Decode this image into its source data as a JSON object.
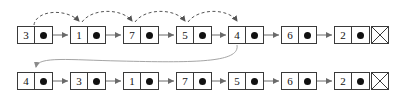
{
  "figure": {
    "background_color": "#ffffff",
    "node_border_color": "#3a3a3a",
    "text_color": "#111111",
    "arrow_color": "#6a6a6a",
    "dashed_arc_color": "#555555",
    "curve_color": "#9a9a9a",
    "pointer_symbol": "•",
    "null_symbol": "X"
  },
  "rows": [
    {
      "id": "top-row",
      "name": "before",
      "y": 26,
      "nodes": [
        {
          "key": "3",
          "ptr": "•",
          "x": 17
        },
        {
          "key": "1",
          "ptr": "•",
          "x": 70
        },
        {
          "key": "7",
          "ptr": "•",
          "x": 123
        },
        {
          "key": "5",
          "ptr": "•",
          "x": 176
        },
        {
          "key": "4",
          "ptr": "•",
          "x": 228
        },
        {
          "key": "6",
          "ptr": "•",
          "x": 281
        },
        {
          "key": "2",
          "ptr": "•",
          "x": 334
        }
      ],
      "terminator": {
        "x": 371,
        "y": 26,
        "label": "null"
      }
    },
    {
      "id": "bottom-row",
      "name": "after",
      "y": 72,
      "nodes": [
        {
          "key": "4",
          "ptr": "•",
          "x": 17
        },
        {
          "key": "3",
          "ptr": "•",
          "x": 70
        },
        {
          "key": "1",
          "ptr": "•",
          "x": 123
        },
        {
          "key": "7",
          "ptr": "•",
          "x": 176
        },
        {
          "key": "5",
          "ptr": "•",
          "x": 228
        },
        {
          "key": "6",
          "ptr": "•",
          "x": 281
        },
        {
          "key": "2",
          "ptr": "•",
          "x": 334
        }
      ],
      "terminator": {
        "x": 371,
        "y": 72,
        "label": "null"
      }
    }
  ],
  "next_arrows": {
    "style": "solid",
    "top": [
      {
        "x1": 53,
        "x2": 69,
        "y": 35
      },
      {
        "x1": 106,
        "x2": 122,
        "y": 35
      },
      {
        "x1": 159,
        "x2": 175,
        "y": 35
      },
      {
        "x1": 212,
        "x2": 227,
        "y": 35
      },
      {
        "x1": 264,
        "x2": 280,
        "y": 35
      },
      {
        "x1": 317,
        "x2": 333,
        "y": 35
      },
      {
        "x1": 370,
        "x2": 370,
        "y": 35
      }
    ],
    "bottom": [
      {
        "x1": 53,
        "x2": 69,
        "y": 81
      },
      {
        "x1": 106,
        "x2": 122,
        "y": 81
      },
      {
        "x1": 159,
        "x2": 175,
        "y": 81
      },
      {
        "x1": 212,
        "x2": 227,
        "y": 81
      },
      {
        "x1": 264,
        "x2": 280,
        "y": 81
      },
      {
        "x1": 317,
        "x2": 333,
        "y": 81
      },
      {
        "x1": 370,
        "x2": 370,
        "y": 81
      }
    ]
  },
  "dashed_arcs": {
    "style": "dashed",
    "description": "search-path-arcs",
    "arcs": [
      {
        "from_x": 34,
        "to_x": 80,
        "apex_y": 12
      },
      {
        "from_x": 80,
        "to_x": 133,
        "apex_y": 12
      },
      {
        "from_x": 133,
        "to_x": 186,
        "apex_y": 12
      },
      {
        "from_x": 186,
        "to_x": 238,
        "apex_y": 12
      }
    ]
  },
  "move_curve": {
    "style": "solid",
    "description": "node-4-moved-to-front",
    "from_x": 237,
    "from_y": 45,
    "to_x": 36,
    "to_y": 70
  }
}
